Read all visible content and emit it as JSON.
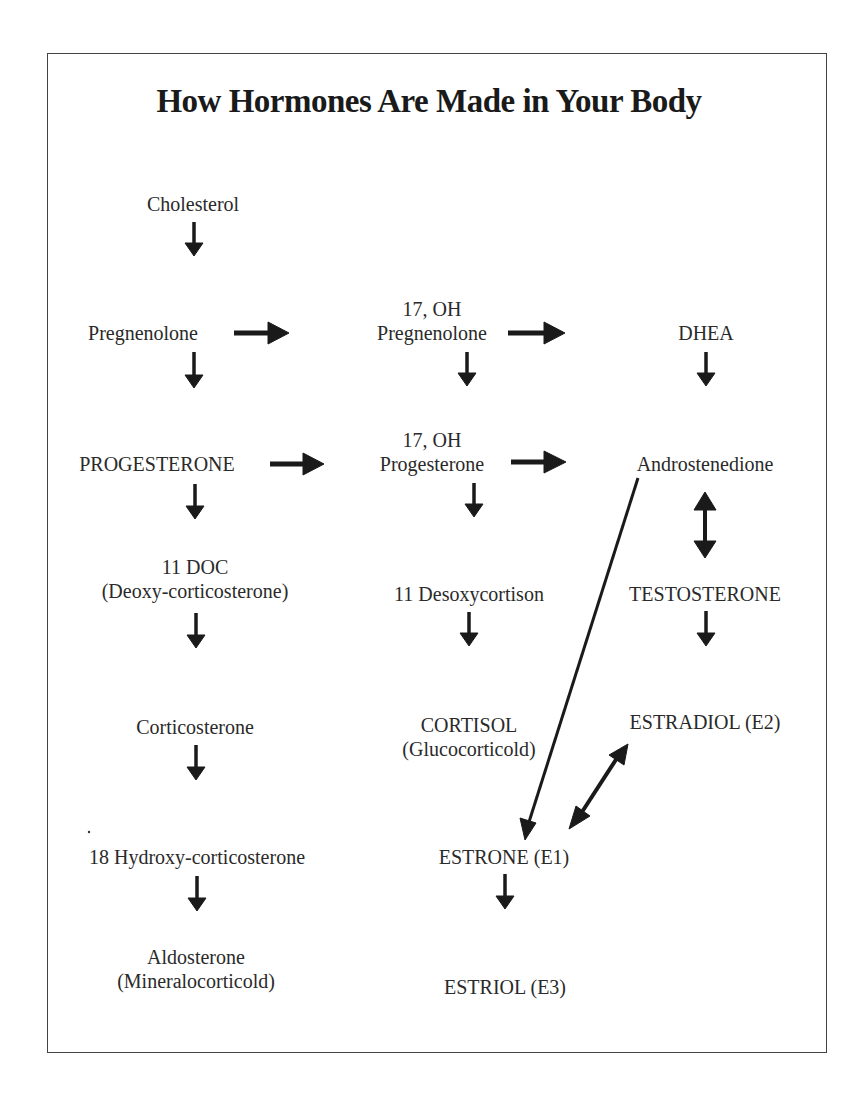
{
  "title": "How Hormones Are Made in Your Body",
  "colors": {
    "text": "#2a2a2a",
    "arrow": "#1a1a1a",
    "border": "#444444",
    "background": "#ffffff"
  },
  "nodes": {
    "cholesterol": {
      "label": "Cholesterol"
    },
    "pregnenolone": {
      "label": "Pregnenolone"
    },
    "oh17_pregnenolone": {
      "line1": "17, OH",
      "line2": "Pregnenolone"
    },
    "dhea": {
      "label": "DHEA"
    },
    "progesterone": {
      "label": "PROGESTERONE"
    },
    "oh17_progesterone": {
      "line1": "17, OH",
      "line2": "Progesterone"
    },
    "androstenedione": {
      "label": "Androstenedione"
    },
    "doc11": {
      "line1": "11 DOC",
      "line2": "(Deoxy-corticosterone)"
    },
    "desoxycortison11": {
      "label": "11 Desoxycortison"
    },
    "testosterone": {
      "label": "TESTOSTERONE"
    },
    "corticosterone": {
      "label": "Corticosterone"
    },
    "cortisol": {
      "line1": "CORTISOL",
      "line2": "(Glucocorticold)"
    },
    "estradiol": {
      "label": "ESTRADIOL (E2)"
    },
    "hydroxy18": {
      "label": "18 Hydroxy-corticosterone"
    },
    "estrone": {
      "label": "ESTRONE (E1)"
    },
    "aldosterone": {
      "line1": "Aldosterone",
      "line2": "(Mineralocorticold)"
    },
    "estriol": {
      "label": "ESTRIOL (E3)"
    }
  },
  "edges": [
    {
      "from": "Cholesterol",
      "to": "Pregnenolone",
      "type": "one-way"
    },
    {
      "from": "Pregnenolone",
      "to": "17, OH Pregnenolone",
      "type": "one-way"
    },
    {
      "from": "17, OH Pregnenolone",
      "to": "DHEA",
      "type": "one-way"
    },
    {
      "from": "Pregnenolone",
      "to": "PROGESTERONE",
      "type": "one-way"
    },
    {
      "from": "17, OH Pregnenolone",
      "to": "17, OH Progesterone",
      "type": "one-way"
    },
    {
      "from": "DHEA",
      "to": "Androstenedione",
      "type": "one-way"
    },
    {
      "from": "PROGESTERONE",
      "to": "17, OH Progesterone",
      "type": "one-way"
    },
    {
      "from": "17, OH Progesterone",
      "to": "Androstenedione",
      "type": "one-way"
    },
    {
      "from": "PROGESTERONE",
      "to": "11 DOC",
      "type": "one-way"
    },
    {
      "from": "17, OH Progesterone",
      "to": "11 Desoxycortison",
      "type": "one-way"
    },
    {
      "from": "Androstenedione",
      "to": "TESTOSTERONE",
      "type": "two-way"
    },
    {
      "from": "11 DOC",
      "to": "Corticosterone",
      "type": "one-way"
    },
    {
      "from": "11 Desoxycortison",
      "to": "CORTISOL",
      "type": "one-way"
    },
    {
      "from": "TESTOSTERONE",
      "to": "ESTRADIOL (E2)",
      "type": "one-way"
    },
    {
      "from": "Corticosterone",
      "to": "18 Hydroxy-corticosterone",
      "type": "one-way"
    },
    {
      "from": "Androstenedione",
      "to": "ESTRONE (E1)",
      "type": "one-way"
    },
    {
      "from": "ESTRADIOL (E2)",
      "to": "ESTRONE (E1)",
      "type": "two-way"
    },
    {
      "from": "18 Hydroxy-corticosterone",
      "to": "Aldosterone",
      "type": "one-way"
    },
    {
      "from": "ESTRONE (E1)",
      "to": "ESTRIOL (E3)",
      "type": "one-way"
    }
  ]
}
